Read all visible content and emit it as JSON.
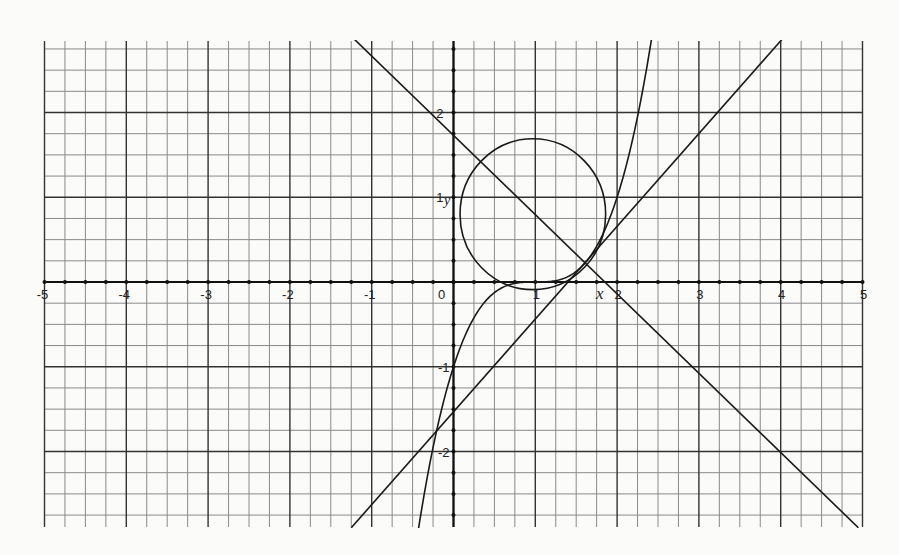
{
  "chart_data": {
    "type": "line",
    "title": "",
    "xlabel": "x",
    "ylabel": "y",
    "xlim": [
      -5,
      5
    ],
    "ylim": [
      -2.9,
      2.9
    ],
    "grid": true,
    "grid_minor_step": 0.25,
    "x_ticks": [
      "-5",
      "-4",
      "-3",
      "-2",
      "-1",
      "0",
      "1",
      "2",
      "3",
      "4",
      "5"
    ],
    "y_ticks": [
      "2",
      "1",
      "-1",
      "-2"
    ],
    "series": [
      {
        "name": "cubic y=(x-1)^3",
        "kind": "function",
        "expression": "(x-1)^3",
        "x_range": [
          -0.43,
          2.43
        ]
      },
      {
        "name": "tangent line (positive slope)",
        "kind": "line",
        "points": [
          [
            -1.25,
            -2.9
          ],
          [
            4.05,
            2.9
          ]
        ]
      },
      {
        "name": "line (negative slope)",
        "kind": "line",
        "points": [
          [
            -1.25,
            2.9
          ],
          [
            4.95,
            -2.9
          ]
        ]
      },
      {
        "name": "circle",
        "kind": "circle",
        "center": [
          0.97,
          0.8
        ],
        "radius": 0.89
      }
    ],
    "legend": null
  },
  "labels": {
    "x_axis_var": "x",
    "y_axis_var": "y",
    "origin": "0"
  },
  "colors": {
    "background": "#fbfbfa",
    "grid": "#8a8a8a",
    "major_grid": "#333333",
    "axis": "#111111",
    "curve": "#1a1a1a"
  }
}
